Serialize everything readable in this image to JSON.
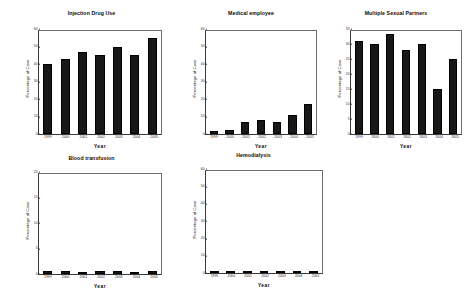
{
  "chart_data": [
    {
      "type": "bar",
      "title": "Injection Drug Use",
      "xlabel": "Year",
      "ylabel": "Percentage of Case",
      "categories": [
        "1999",
        "2000",
        "2001",
        "2002",
        "2003",
        "2004",
        "2005"
      ],
      "values": [
        40,
        43,
        47,
        45,
        50,
        45,
        55
      ],
      "ylim": [
        0,
        60
      ],
      "yticks": [
        "0",
        "10",
        "20",
        "30",
        "40",
        "50",
        "60"
      ],
      "ytick_values": [
        0,
        10,
        20,
        30,
        40,
        50,
        60
      ],
      "grid": false,
      "legend": "none",
      "bar_color": "#171717"
    },
    {
      "type": "bar",
      "title": "Medical employee",
      "xlabel": "Year",
      "ylabel": "Percentage of Case",
      "categories": [
        "1999",
        "2000",
        "2001",
        "2002",
        "2003",
        "2004",
        "2005"
      ],
      "values": [
        2,
        2.5,
        7,
        8,
        7,
        11,
        17
      ],
      "ylim": [
        0,
        60
      ],
      "yticks": [
        "0",
        "10",
        "20",
        "30",
        "40",
        "50",
        "60"
      ],
      "ytick_values": [
        0,
        10,
        20,
        30,
        40,
        50,
        60
      ],
      "grid": false,
      "legend": "none",
      "bar_color": "#171717"
    },
    {
      "type": "bar",
      "title": "Multiple Sexual Partners",
      "xlabel": "Year",
      "ylabel": "Percentage of Case",
      "categories": [
        "1999",
        "2000",
        "2001",
        "2002",
        "2003",
        "2004",
        "2005"
      ],
      "values": [
        31,
        30,
        33.5,
        28,
        30,
        15,
        25
      ],
      "ylim": [
        0,
        35
      ],
      "yticks": [
        "0",
        "5",
        "10",
        "15",
        "20",
        "25",
        "30",
        "35"
      ],
      "ytick_values": [
        0,
        5,
        10,
        15,
        20,
        25,
        30,
        35
      ],
      "grid": false,
      "legend": "none",
      "bar_color": "#171717"
    },
    {
      "type": "bar",
      "title": "Blood transfusion",
      "xlabel": "Year",
      "ylabel": "Percentage of Case",
      "categories": [
        "1999",
        "2000",
        "2001",
        "2002",
        "2003",
        "2004",
        "2005"
      ],
      "values": [
        0.6,
        0.6,
        0.15,
        0.5,
        0.6,
        0.4,
        0.6
      ],
      "ylim": [
        0,
        20
      ],
      "yticks": [
        "0",
        "5",
        "10",
        "15",
        "20"
      ],
      "ytick_values": [
        0,
        5,
        10,
        15,
        20
      ],
      "grid": false,
      "legend": "none",
      "bar_color": "#171717"
    },
    {
      "type": "bar",
      "title": "Hemodialysis",
      "xlabel": "Year",
      "ylabel": "Percentage of Case",
      "categories": [
        "1999",
        "2000",
        "2001",
        "2002",
        "2003",
        "2004",
        "2005"
      ],
      "values": [
        1.1,
        1.1,
        0.25,
        0.9,
        1.1,
        0.3,
        0.2
      ],
      "ylim": [
        0,
        60
      ],
      "yticks": [
        "0",
        "10",
        "20",
        "30",
        "40",
        "50",
        "60"
      ],
      "ytick_values": [
        0,
        10,
        20,
        30,
        40,
        50,
        60
      ],
      "grid": false,
      "legend": "none",
      "bar_color": "#171717"
    }
  ]
}
